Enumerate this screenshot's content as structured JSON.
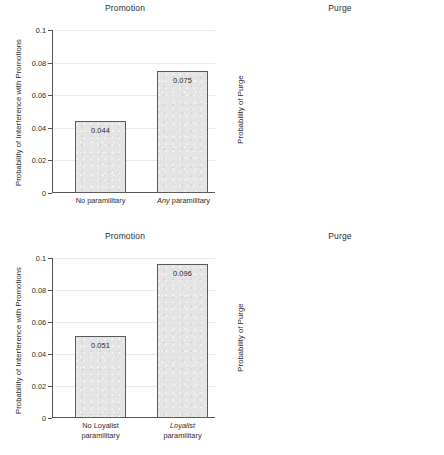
{
  "figure": {
    "width": 444,
    "height": 455,
    "layout": "2x2 panel grid",
    "bar_fill_color": "#e4e4e4",
    "bar_border_color": "#5a5a5a",
    "grid_color": "#e9e9e9",
    "axis_color": "#555555"
  },
  "chart_data": [
    {
      "type": "bar",
      "panel": "top-left",
      "title": "Promotion",
      "xlabel": "",
      "ylabel": "Probability of Interference with Promotions",
      "ylim": [
        0,
        0.1
      ],
      "yticks": [
        "0",
        "0.02",
        "0.04",
        "0.06",
        "0.08",
        "0.1"
      ],
      "ytick_values": [
        0,
        0.02,
        0.04,
        0.06,
        0.08,
        0.1
      ],
      "grid": true,
      "legend": "none",
      "categories": [
        "No paramilitary",
        "Any paramilitary"
      ],
      "category_italic_prefix": [
        "",
        "Any"
      ],
      "values": [
        0.044,
        0.075
      ],
      "value_labels": [
        "0.044",
        "0.075"
      ]
    },
    {
      "type": "bar",
      "panel": "top-right",
      "title": "Purge",
      "xlabel": "",
      "ylabel": "Probability of Purge",
      "ylim": [
        0,
        0.1
      ],
      "yticks": [
        "0",
        "0.02",
        "0.04",
        "0.06",
        "0.08",
        "0.1"
      ],
      "ytick_values": [
        0,
        0.02,
        0.04,
        0.06,
        0.08,
        0.1
      ],
      "grid": true,
      "legend": "none",
      "categories": [
        "No paramilitary",
        "Any paramilitary"
      ],
      "category_italic_prefix": [
        "",
        "Any"
      ],
      "values": [
        0.025,
        0.031
      ],
      "value_labels": [
        "0.025",
        "0.031"
      ]
    },
    {
      "type": "bar",
      "panel": "bottom-left",
      "title": "Promotion",
      "xlabel": "",
      "ylabel": "Probability of Interference with Promotions",
      "ylim": [
        0,
        0.1
      ],
      "yticks": [
        "0",
        "0.02",
        "0.04",
        "0.06",
        "0.08",
        "0.1"
      ],
      "ytick_values": [
        0,
        0.02,
        0.04,
        0.06,
        0.08,
        0.1
      ],
      "grid": true,
      "legend": "none",
      "categories": [
        "No Loyalist paramilitary",
        "Loyalist paramilitary"
      ],
      "category_lines": [
        [
          "No Loyalist",
          "paramilitary"
        ],
        [
          "Loyalist",
          "paramilitary"
        ]
      ],
      "category_italic_prefix": [
        "",
        "Loyalist"
      ],
      "values": [
        0.051,
        0.096
      ],
      "value_labels": [
        "0.051",
        "0.096"
      ]
    },
    {
      "type": "bar",
      "panel": "bottom-right",
      "title": "Purge",
      "xlabel": "",
      "ylabel": "Probability of Purge",
      "ylim": [
        0,
        0.1
      ],
      "yticks": [
        "0",
        "0.02",
        "0.04",
        "0.06",
        "0.08",
        "0.1"
      ],
      "ytick_values": [
        0,
        0.02,
        0.04,
        0.06,
        0.08,
        0.1
      ],
      "grid": true,
      "legend": "none",
      "categories": [
        "No Loyalist paramilitary",
        "Loyalist paramilitary"
      ],
      "category_lines": [
        [
          "No Loyalist",
          "paramilitary"
        ],
        [
          "Loyalist",
          "paramilitary"
        ]
      ],
      "category_italic_prefix": [
        "",
        "Loyalist"
      ],
      "values": [
        0.025,
        0.038
      ],
      "value_labels": [
        "0.025",
        "0.038"
      ]
    }
  ]
}
